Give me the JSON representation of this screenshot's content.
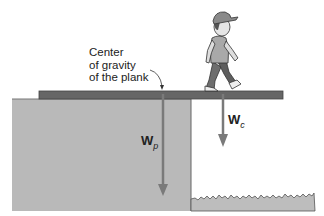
{
  "diagram": {
    "annotation": {
      "lines": [
        "Center",
        "of gravity",
        "of the plank"
      ]
    },
    "forces": [
      {
        "symbol": "W",
        "subscript": "p",
        "meaning": "weight of plank"
      },
      {
        "symbol": "W",
        "subscript": "c",
        "meaning": "weight of child"
      }
    ],
    "colors": {
      "ledge": "#b9b9b9",
      "plank": "#666666",
      "arrow": "#7a7a7a",
      "grass": "#bdbdbd",
      "outline": "#555555"
    }
  }
}
